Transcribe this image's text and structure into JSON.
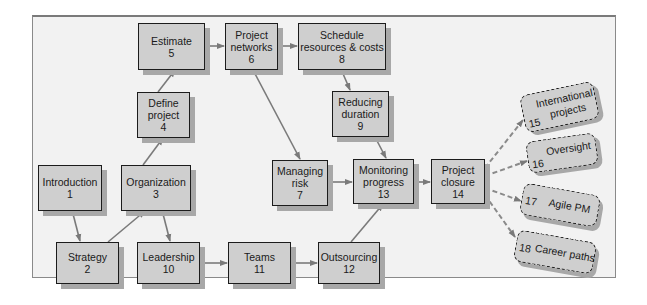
{
  "diagram": {
    "colors": {
      "background": "#f2f2f2",
      "box_fill": "#cfcfcf",
      "box_border": "#1c1c1c",
      "shadow": "#a8a8a8",
      "arrow": "#7a7a7a"
    },
    "nodes": [
      {
        "id": 1,
        "label": "Introduction",
        "number": "1"
      },
      {
        "id": 2,
        "label": "Strategy",
        "number": "2"
      },
      {
        "id": 3,
        "label": "Organization",
        "number": "3"
      },
      {
        "id": 4,
        "label": "Define project",
        "label_lines": [
          "Define",
          "project"
        ],
        "number": "4"
      },
      {
        "id": 5,
        "label": "Estimate",
        "number": "5"
      },
      {
        "id": 6,
        "label": "Project networks",
        "label_lines": [
          "Project",
          "networks"
        ],
        "number": "6"
      },
      {
        "id": 7,
        "label": "Managing risk",
        "label_lines": [
          "Managing",
          "risk"
        ],
        "number": "7"
      },
      {
        "id": 8,
        "label": "Schedule resources & costs",
        "label_lines": [
          "Schedule",
          "resources & costs"
        ],
        "number": "8"
      },
      {
        "id": 9,
        "label": "Reducing duration",
        "label_lines": [
          "Reducing",
          "duration"
        ],
        "number": "9"
      },
      {
        "id": 10,
        "label": "Leadership",
        "number": "10"
      },
      {
        "id": 11,
        "label": "Teams",
        "number": "11"
      },
      {
        "id": 12,
        "label": "Outsourcing",
        "number": "12"
      },
      {
        "id": 13,
        "label": "Monitoring progress",
        "label_lines": [
          "Monitoring",
          "progress"
        ],
        "number": "13"
      },
      {
        "id": 14,
        "label": "Project closure",
        "label_lines": [
          "Project",
          "closure"
        ],
        "number": "14"
      }
    ],
    "optional_nodes": [
      {
        "id": 15,
        "label": "International projects",
        "label_lines": [
          "International",
          "projects"
        ],
        "number": "15"
      },
      {
        "id": 16,
        "label": "Oversight",
        "number": "16"
      },
      {
        "id": 17,
        "label": "Agile PM",
        "number": "17"
      },
      {
        "id": 18,
        "label": "Career paths",
        "number": "18"
      }
    ],
    "edges": [
      {
        "from": 1,
        "to": 2,
        "style": "solid"
      },
      {
        "from": 2,
        "to": 3,
        "style": "solid"
      },
      {
        "from": 3,
        "to": 4,
        "style": "solid"
      },
      {
        "from": 3,
        "to": 10,
        "style": "solid"
      },
      {
        "from": 4,
        "to": 5,
        "style": "solid"
      },
      {
        "from": 5,
        "to": 6,
        "style": "solid"
      },
      {
        "from": 6,
        "to": 8,
        "style": "solid"
      },
      {
        "from": 6,
        "to": 7,
        "style": "solid"
      },
      {
        "from": 8,
        "to": 9,
        "style": "solid"
      },
      {
        "from": 9,
        "to": 13,
        "style": "solid"
      },
      {
        "from": 7,
        "to": 13,
        "style": "solid"
      },
      {
        "from": 10,
        "to": 11,
        "style": "solid"
      },
      {
        "from": 11,
        "to": 12,
        "style": "solid"
      },
      {
        "from": 12,
        "to": 13,
        "style": "solid"
      },
      {
        "from": 13,
        "to": 14,
        "style": "solid"
      },
      {
        "from": 14,
        "to": 15,
        "style": "dashed"
      },
      {
        "from": 14,
        "to": 16,
        "style": "dashed"
      },
      {
        "from": 14,
        "to": 17,
        "style": "dashed"
      },
      {
        "from": 14,
        "to": 18,
        "style": "dashed"
      }
    ]
  }
}
